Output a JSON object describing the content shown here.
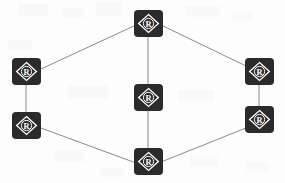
{
  "canvas": {
    "width": 285,
    "height": 183,
    "background_color": "#fdfdfd",
    "title": "Registered Node Network Diagram"
  },
  "style": {
    "node_fill": "#2b2b2b",
    "node_glyph_color": "#ffffff",
    "edge_color": "#8a8a8a",
    "edge_width": 1,
    "node_corner_radius": 4
  },
  "nodes": [
    {
      "id": "node-top-center",
      "label": "R",
      "icon": "registered-trademark-diamond-icon",
      "x": 134,
      "y": 10,
      "width": 29,
      "height": 27
    },
    {
      "id": "node-left-upper",
      "label": "R",
      "icon": "registered-trademark-diamond-icon",
      "x": 12,
      "y": 58,
      "width": 29,
      "height": 27
    },
    {
      "id": "node-right-upper",
      "label": "R",
      "icon": "registered-trademark-diamond-icon",
      "x": 245,
      "y": 58,
      "width": 29,
      "height": 27
    },
    {
      "id": "node-center-middle",
      "label": "R",
      "icon": "registered-trademark-diamond-icon",
      "x": 134,
      "y": 84,
      "width": 29,
      "height": 27
    },
    {
      "id": "node-left-lower",
      "label": "R",
      "icon": "registered-trademark-diamond-icon",
      "x": 12,
      "y": 112,
      "width": 29,
      "height": 27
    },
    {
      "id": "node-right-lower",
      "label": "R",
      "icon": "registered-trademark-diamond-icon",
      "x": 245,
      "y": 106,
      "width": 29,
      "height": 27
    },
    {
      "id": "node-bottom-center",
      "label": "R",
      "icon": "registered-trademark-diamond-icon",
      "x": 134,
      "y": 148,
      "width": 29,
      "height": 27
    }
  ],
  "edges": [
    {
      "id": "edge-left-upper-to-top-center",
      "from": "node-left-upper",
      "to": "node-top-center",
      "x1": 41,
      "y1": 69,
      "x2": 136,
      "y2": 25
    },
    {
      "id": "edge-top-center-to-right-upper",
      "from": "node-top-center",
      "to": "node-right-upper",
      "x1": 161,
      "y1": 25,
      "x2": 246,
      "y2": 66
    },
    {
      "id": "edge-top-center-to-center-middle",
      "from": "node-top-center",
      "to": "node-center-middle",
      "x1": 148,
      "y1": 36,
      "x2": 148,
      "y2": 85
    },
    {
      "id": "edge-center-middle-to-bottom-center",
      "from": "node-center-middle",
      "to": "node-bottom-center",
      "x1": 148,
      "y1": 110,
      "x2": 148,
      "y2": 149
    },
    {
      "id": "edge-left-upper-to-left-lower",
      "from": "node-left-upper",
      "to": "node-left-lower",
      "x1": 26,
      "y1": 84,
      "x2": 26,
      "y2": 113
    },
    {
      "id": "edge-right-upper-to-right-lower",
      "from": "node-right-upper",
      "to": "node-right-lower",
      "x1": 259,
      "y1": 84,
      "x2": 259,
      "y2": 107
    },
    {
      "id": "edge-left-lower-to-bottom-center",
      "from": "node-left-lower",
      "to": "node-bottom-center",
      "x1": 41,
      "y1": 128,
      "x2": 136,
      "y2": 163
    },
    {
      "id": "edge-bottom-center-to-right-lower",
      "from": "node-bottom-center",
      "to": "node-right-lower",
      "x1": 161,
      "y1": 162,
      "x2": 246,
      "y2": 128
    }
  ]
}
